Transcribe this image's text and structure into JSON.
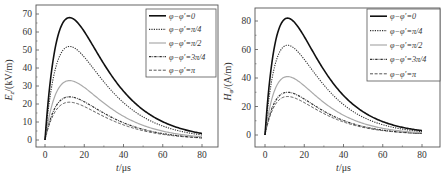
{
  "chart_data": [
    {
      "type": "line",
      "title": "",
      "xlabel": "t/μs",
      "ylabel": "E_z/(kV/m)",
      "ylabel_main": "E",
      "ylabel_sub": "z",
      "ylabel_rest": "/(kV/m)",
      "xlim": [
        -4,
        90
      ],
      "ylim": [
        -5,
        75
      ],
      "xticks": [
        0,
        20,
        40,
        60,
        80
      ],
      "yticks": [
        0,
        10,
        20,
        30,
        40,
        50,
        60,
        70
      ],
      "grid": false,
      "legend_position": "upper right",
      "series": [
        {
          "name": "φ−φ′=0",
          "peak": 68,
          "peak_t": 12.5,
          "style": "solid",
          "color": "#111111",
          "width": 1.6
        },
        {
          "name": "φ−φ′=π/4",
          "peak": 52,
          "peak_t": 12.5,
          "style": "dotted",
          "color": "#333333",
          "width": 1.1
        },
        {
          "name": "φ−φ′=π/2",
          "peak": 33,
          "peak_t": 12.5,
          "style": "solid",
          "color": "#aaaaaa",
          "width": 1.2
        },
        {
          "name": "φ−φ′=3π/4",
          "peak": 24,
          "peak_t": 12.5,
          "style": "dashdot",
          "color": "#333333",
          "width": 1.2
        },
        {
          "name": "φ−φ′=π",
          "peak": 21,
          "peak_t": 12.5,
          "style": "dashed",
          "color": "#555555",
          "width": 1.0
        }
      ],
      "x": [
        0,
        2,
        4,
        6,
        8,
        10,
        12,
        14,
        16,
        18,
        20,
        25,
        30,
        35,
        40,
        45,
        50,
        60,
        70,
        80
      ]
    },
    {
      "type": "line",
      "title": "",
      "xlabel": "t/μs",
      "ylabel": "H_φ/(A/m)",
      "ylabel_main": "H",
      "ylabel_sub": "φ",
      "ylabel_rest": "/(A/m)",
      "xlim": [
        -4,
        90
      ],
      "ylim": [
        -10,
        90
      ],
      "xticks": [
        0,
        20,
        40,
        60,
        80
      ],
      "yticks": [
        0,
        20,
        40,
        60,
        80
      ],
      "grid": false,
      "legend_position": "upper right",
      "series": [
        {
          "name": "φ−φ′=0",
          "peak": 82,
          "peak_t": 11.5,
          "style": "solid",
          "color": "#111111",
          "width": 1.6
        },
        {
          "name": "φ−φ′=π/4",
          "peak": 63,
          "peak_t": 11.5,
          "style": "dotted",
          "color": "#333333",
          "width": 1.1
        },
        {
          "name": "φ−φ′=π/2",
          "peak": 41,
          "peak_t": 11.5,
          "style": "solid",
          "color": "#aaaaaa",
          "width": 1.2
        },
        {
          "name": "φ−φ′=3π/4",
          "peak": 30,
          "peak_t": 11.5,
          "style": "dashdot",
          "color": "#333333",
          "width": 1.2
        },
        {
          "name": "φ−φ′=π",
          "peak": 27,
          "peak_t": 11.5,
          "style": "dashed",
          "color": "#555555",
          "width": 1.0
        }
      ],
      "x": [
        0,
        2,
        4,
        6,
        8,
        10,
        12,
        14,
        16,
        18,
        20,
        25,
        30,
        35,
        40,
        45,
        50,
        60,
        70,
        80
      ]
    }
  ],
  "panels": [
    {
      "frame": {
        "left": 36,
        "top": 5,
        "right": 218,
        "bottom": 147
      },
      "x0px": 45,
      "x80px": 202,
      "y0px": 140,
      "yTopVal": 70,
      "yTopPx": 14,
      "legend": {
        "x": 146,
        "y": 9,
        "w": 70,
        "h": 68
      }
    },
    {
      "frame": {
        "left": 33,
        "top": 8,
        "right": 218,
        "bottom": 147
      },
      "x0px": 43,
      "x80px": 200,
      "y0px": 135,
      "yTopVal": 80,
      "yTopPx": 21,
      "legend": {
        "x": 145,
        "y": 9,
        "w": 73,
        "h": 72
      }
    }
  ]
}
